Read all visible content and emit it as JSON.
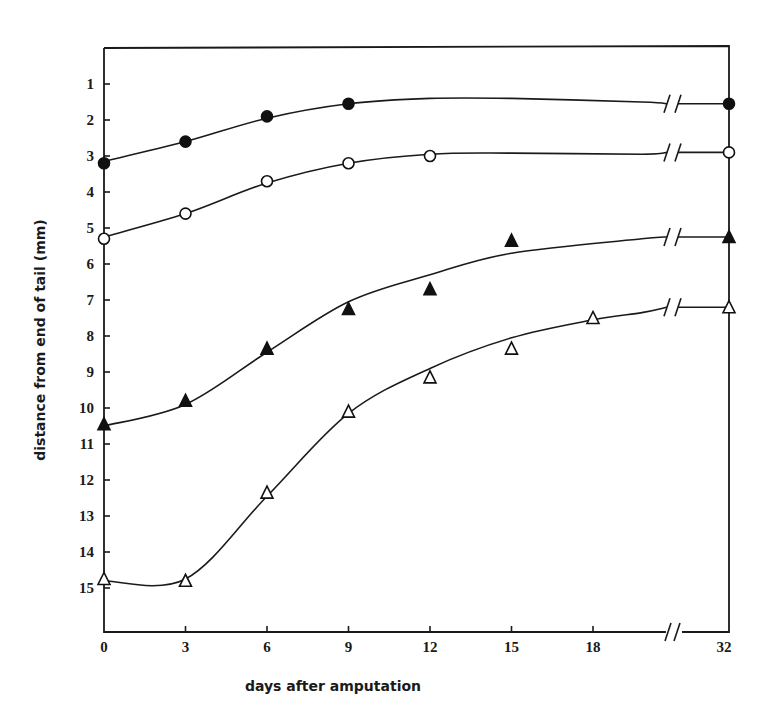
{
  "chart_data": {
    "type": "line",
    "title": "",
    "xlabel": "days after amputation",
    "ylabel": "distance from end of tail (mm)",
    "x_tick_labels": [
      "0",
      "3",
      "6",
      "9",
      "12",
      "15",
      "18",
      "32"
    ],
    "y_tick_labels": [
      "1",
      "2",
      "3",
      "4",
      "5",
      "6",
      "7",
      "8",
      "9",
      "10",
      "11",
      "12",
      "13",
      "14",
      "15"
    ],
    "y_inverted": true,
    "ylim": [
      0,
      16.3
    ],
    "x_axis_break": {
      "between": [
        18,
        32
      ]
    },
    "grid": false,
    "legend": null,
    "series": [
      {
        "name": "filled circles",
        "marker": "filled-circle",
        "x": [
          0,
          3,
          6,
          9,
          32
        ],
        "y": [
          3.2,
          2.6,
          1.9,
          1.55,
          1.55
        ],
        "curve": [
          [
            0,
            3.15
          ],
          [
            3,
            2.6
          ],
          [
            6,
            1.95
          ],
          [
            9,
            1.55
          ],
          [
            12,
            1.4
          ],
          [
            15,
            1.4
          ],
          [
            19.8,
            1.5
          ],
          [
            32,
            1.55
          ]
        ]
      },
      {
        "name": "open circles",
        "marker": "open-circle",
        "x": [
          0,
          3,
          6,
          9,
          12,
          32
        ],
        "y": [
          5.3,
          4.6,
          3.7,
          3.2,
          3.0,
          2.9
        ],
        "curve": [
          [
            0,
            5.25
          ],
          [
            3,
            4.6
          ],
          [
            6,
            3.75
          ],
          [
            9,
            3.2
          ],
          [
            12,
            2.95
          ],
          [
            15,
            2.92
          ],
          [
            19.8,
            2.95
          ],
          [
            32,
            2.9
          ]
        ]
      },
      {
        "name": "filled triangles",
        "marker": "filled-triangle",
        "x": [
          0,
          3,
          6,
          9,
          12,
          15,
          32
        ],
        "y": [
          10.45,
          9.8,
          8.35,
          7.25,
          6.7,
          5.35,
          5.25
        ],
        "curve": [
          [
            0,
            10.5
          ],
          [
            3,
            9.9
          ],
          [
            6,
            8.45
          ],
          [
            9,
            7.05
          ],
          [
            12,
            6.3
          ],
          [
            15,
            5.7
          ],
          [
            19.8,
            5.3
          ],
          [
            32,
            5.25
          ]
        ]
      },
      {
        "name": "open triangles",
        "marker": "open-triangle",
        "x": [
          0,
          3,
          6,
          9,
          12,
          15,
          18,
          32
        ],
        "y": [
          14.75,
          14.8,
          12.35,
          10.1,
          9.15,
          8.35,
          7.5,
          7.2
        ],
        "curve": [
          [
            0,
            14.8
          ],
          [
            3,
            14.75
          ],
          [
            6,
            12.45
          ],
          [
            9,
            10.15
          ],
          [
            12,
            8.9
          ],
          [
            15,
            8.05
          ],
          [
            18,
            7.55
          ],
          [
            19.8,
            7.35
          ],
          [
            32,
            7.2
          ]
        ]
      }
    ]
  }
}
